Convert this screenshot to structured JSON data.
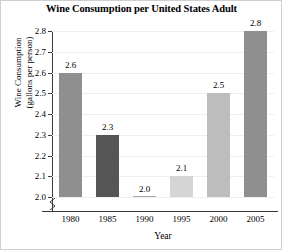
{
  "chart_data": {
    "type": "bar",
    "title": "Wine Consumption per United States Adult",
    "xlabel": "Year",
    "ylabel": "Wine Consumption (gallons per person)",
    "ylabel_line1": "Wine Consumption",
    "ylabel_line2": "(gallons per person)",
    "categories": [
      "1980",
      "1985",
      "1990",
      "1995",
      "2000",
      "2005"
    ],
    "values": [
      2.6,
      2.3,
      2.0,
      2.1,
      2.5,
      2.8
    ],
    "value_labels": [
      "2.6",
      "2.3",
      "2.0",
      "2.1",
      "2.5",
      "2.8"
    ],
    "bar_colors": [
      "#8f8f8f",
      "#555555",
      "#ababab",
      "#d5d5d5",
      "#bdbdbd",
      "#8f8f8f"
    ],
    "ylim": [
      2.0,
      2.8
    ],
    "ytick_values": [
      2.0,
      2.1,
      2.2,
      2.3,
      2.4,
      2.5,
      2.6,
      2.7,
      2.8
    ],
    "ytick_labels": [
      "2.0",
      "2.1",
      "2.2",
      "2.3",
      "2.4",
      "2.5",
      "2.6",
      "2.7",
      "2.8"
    ],
    "grid": true,
    "legend": "none",
    "axis_break": true,
    "axis_break_note": "y-axis truncated below 2.0"
  }
}
